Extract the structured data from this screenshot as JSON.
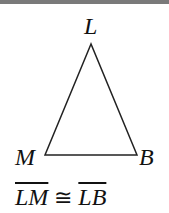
{
  "figure": {
    "vertices": [
      {
        "name": "L",
        "x": 91,
        "y": 44
      },
      {
        "name": "M",
        "x": 45,
        "y": 155
      },
      {
        "name": "B",
        "x": 137,
        "y": 155
      }
    ],
    "labels": {
      "top": "L",
      "left": "M",
      "right": "B"
    },
    "stroke_color": "#222222"
  },
  "statement": {
    "segment1": "LM",
    "symbol": "≅",
    "segment2": "LB"
  }
}
